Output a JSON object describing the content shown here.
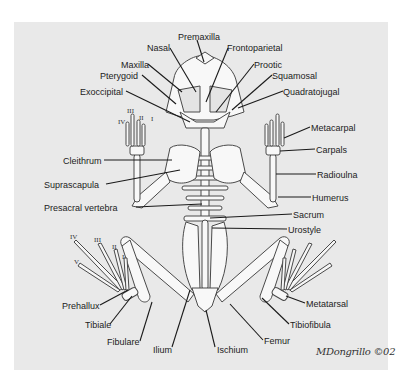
{
  "diagram": {
    "colors": {
      "panel": "#e9e9e9",
      "bone": "#f8f8f8",
      "bone_stroke": "#4a4a4a",
      "leader": "#1a1a1a",
      "text": "#222222"
    },
    "labels": [
      {
        "id": "premaxilla",
        "text": "Premaxilla",
        "x": 178,
        "y": 32
      },
      {
        "id": "nasal",
        "text": "Nasal",
        "x": 147,
        "y": 43
      },
      {
        "id": "frontoparietal",
        "text": "Frontoparietal",
        "x": 227,
        "y": 43
      },
      {
        "id": "maxilla",
        "text": "Maxilla",
        "x": 121,
        "y": 60
      },
      {
        "id": "prootic",
        "text": "Prootic",
        "x": 254,
        "y": 60
      },
      {
        "id": "pterygoid",
        "text": "Pterygoid",
        "x": 100,
        "y": 71
      },
      {
        "id": "squamosal",
        "text": "Squamosal",
        "x": 272,
        "y": 71
      },
      {
        "id": "exoccipital",
        "text": "Exoccipital",
        "x": 80,
        "y": 87
      },
      {
        "id": "quadratojugal",
        "text": "Quadratojugal",
        "x": 283,
        "y": 87
      },
      {
        "id": "metacarpal",
        "text": "Metacarpal",
        "x": 311,
        "y": 123
      },
      {
        "id": "carpals",
        "text": "Carpals",
        "x": 316,
        "y": 145
      },
      {
        "id": "cleithrum",
        "text": "Cleithrum",
        "x": 63,
        "y": 156
      },
      {
        "id": "radioulna",
        "text": "Radioulna",
        "x": 317,
        "y": 170
      },
      {
        "id": "suprascapula",
        "text": "Suprascapula",
        "x": 44,
        "y": 180
      },
      {
        "id": "humerus",
        "text": "Humerus",
        "x": 312,
        "y": 193
      },
      {
        "id": "presacral-vertebra",
        "text": "Presacral vertebra",
        "x": 44,
        "y": 203
      },
      {
        "id": "sacrum",
        "text": "Sacrum",
        "x": 293,
        "y": 210
      },
      {
        "id": "urostyle",
        "text": "Urostyle",
        "x": 288,
        "y": 225
      },
      {
        "id": "prehallux",
        "text": "Prehallux",
        "x": 62,
        "y": 301
      },
      {
        "id": "metatarsal",
        "text": "Metatarsal",
        "x": 306,
        "y": 299
      },
      {
        "id": "tibiale",
        "text": "Tibiale",
        "x": 85,
        "y": 320
      },
      {
        "id": "tibiofibula",
        "text": "Tibiofibula",
        "x": 290,
        "y": 320
      },
      {
        "id": "fibulare",
        "text": "Fibulare",
        "x": 107,
        "y": 337
      },
      {
        "id": "femur",
        "text": "Femur",
        "x": 264,
        "y": 336
      },
      {
        "id": "ilium",
        "text": "Ilium",
        "x": 153,
        "y": 345
      },
      {
        "id": "ischium",
        "text": "Ischium",
        "x": 217,
        "y": 345
      }
    ],
    "digit_labels": {
      "hand": [
        {
          "text": "III",
          "x": 127,
          "y": 107
        },
        {
          "text": "IV",
          "x": 118,
          "y": 118
        },
        {
          "text": "II",
          "x": 139,
          "y": 114
        },
        {
          "text": "I",
          "x": 151,
          "y": 115
        }
      ],
      "foot": [
        {
          "text": "IV",
          "x": 70,
          "y": 233
        },
        {
          "text": "III",
          "x": 94,
          "y": 236
        },
        {
          "text": "II",
          "x": 112,
          "y": 243
        },
        {
          "text": "V",
          "x": 74,
          "y": 258
        },
        {
          "text": "I",
          "x": 122,
          "y": 253
        }
      ]
    },
    "signature": "MDongrillo ©02"
  }
}
